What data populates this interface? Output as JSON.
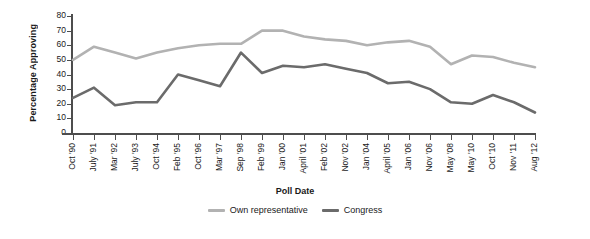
{
  "chart_data": {
    "type": "line",
    "title": "",
    "xlabel": "Poll Date",
    "ylabel": "Percentage Approving",
    "ylim": [
      0,
      80
    ],
    "yticks": [
      0,
      10,
      20,
      30,
      40,
      50,
      60,
      70,
      80
    ],
    "grid": false,
    "legend_position": "bottom",
    "categories": [
      "Oct '90",
      "July '91",
      "Mar '92",
      "July '93",
      "Oct '94",
      "Feb '95",
      "Oct '96",
      "Mar '97",
      "Sep '98",
      "Feb '99",
      "Jan '00",
      "April '01",
      "Feb '02",
      "Nov '02",
      "Jan '04",
      "April '05",
      "Jan '06",
      "Nov '06",
      "May '08",
      "May '10",
      "Oct '10",
      "Nov '11",
      "Aug '12"
    ],
    "series": [
      {
        "name": "Own representative",
        "color": "#b2b2b2",
        "values": [
          50,
          59,
          55,
          51,
          55,
          58,
          60,
          61,
          61,
          70,
          70,
          66,
          64,
          63,
          60,
          62,
          63,
          59,
          47,
          53,
          52,
          48,
          45
        ]
      },
      {
        "name": "Congress",
        "color": "#6b6b6b",
        "values": [
          24,
          31,
          19,
          21,
          21,
          40,
          36,
          32,
          55,
          41,
          46,
          45,
          47,
          44,
          41,
          34,
          35,
          30,
          21,
          20,
          26,
          21,
          14
        ]
      }
    ]
  },
  "legend": {
    "items": [
      {
        "label": "Own representative",
        "color": "#b2b2b2"
      },
      {
        "label": "Congress",
        "color": "#6b6b6b"
      }
    ]
  },
  "axes": {
    "y_title": "Percentage Approving",
    "x_title": "Poll Date"
  }
}
